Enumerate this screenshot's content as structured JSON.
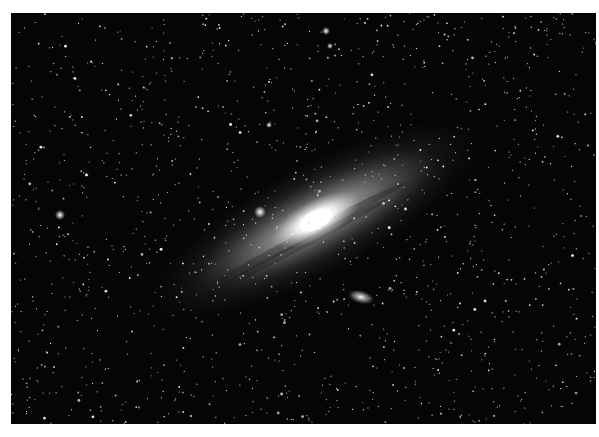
{
  "image": {
    "subject": "Spiral galaxy with dense star field",
    "alt": "Grayscale astrophotograph of a large spiral galaxy tilted diagonally across a dense field of stars, with a small satellite galaxy below",
    "colors": {
      "background": "#ffffff",
      "sky": "#050505",
      "core": "#ffffff",
      "halo": "#9a9a9a"
    }
  }
}
